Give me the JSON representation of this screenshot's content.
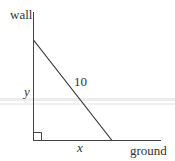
{
  "diagram": {
    "labels": {
      "wall": "wall",
      "ground": "ground",
      "ladder_length": "10",
      "height": "y",
      "base": "x"
    },
    "colors": {
      "line": "#333333",
      "band": "#e4e4e4"
    }
  }
}
